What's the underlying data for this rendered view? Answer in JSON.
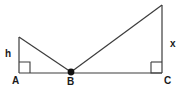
{
  "figure": {
    "background_color": "#ffffff",
    "stroke_color": "#3c3c3c",
    "label_color": "#1a1a1a",
    "width": 185,
    "height": 90,
    "points": {
      "A": {
        "x": 19,
        "y": 73,
        "label": "A"
      },
      "B": {
        "x": 71,
        "y": 72,
        "label": "B"
      },
      "C": {
        "x": 162,
        "y": 73,
        "label": "C"
      },
      "left_apex": {
        "x": 19,
        "y": 37
      },
      "right_apex": {
        "x": 162,
        "y": 5
      }
    },
    "segments": [
      {
        "name": "segment-h-vertical",
        "from": "left_apex",
        "to": "A"
      },
      {
        "name": "segment-left-hypotenuse",
        "from": "left_apex",
        "to": "B"
      },
      {
        "name": "segment-baseline-AC",
        "from": "A",
        "to": "C"
      },
      {
        "name": "segment-right-hypotenuse",
        "from": "B",
        "to": "right_apex"
      },
      {
        "name": "segment-x-vertical",
        "from": "right_apex",
        "to": "C"
      }
    ],
    "right_angle_marks": [
      {
        "name": "right-angle-at-A",
        "x": 19,
        "y": 62,
        "size": 11
      },
      {
        "name": "right-angle-at-C",
        "x": 151,
        "y": 62,
        "size": 11
      }
    ],
    "vertex_dot": {
      "name": "point-B-dot",
      "x": 71,
      "y": 72,
      "radius": 3.4
    },
    "labels": {
      "A": "A",
      "B": "B",
      "C": "C",
      "h": "h",
      "x": "x"
    }
  }
}
